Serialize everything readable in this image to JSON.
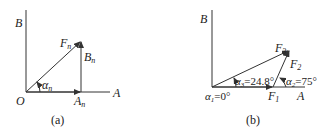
{
  "figure_a": {
    "caption": "(a)",
    "labels": {
      "B": "B",
      "O": "O",
      "A": "A",
      "Fn": "F",
      "Fn_sub": "n",
      "Bn": "B",
      "Bn_sub": "n",
      "An": "A",
      "An_sub": "n",
      "alpha": "α",
      "alpha_sub": "n"
    }
  },
  "figure_b": {
    "caption": "(b)",
    "labels": {
      "B": "B",
      "A": "A",
      "F1": "F",
      "F1_sub": "1",
      "F2": "F",
      "F2_sub": "2",
      "F3": "F",
      "F3_sub": "3",
      "alpha1": "α",
      "alpha1_sub": "1",
      "alpha1_val": "=0°",
      "alpha2": "α",
      "alpha2_sub": "2",
      "alpha2_val": "=75°",
      "alpha3": "α",
      "alpha3_sub": "3",
      "alpha3_val": "=24.8°"
    }
  },
  "colors": {
    "line": "#333333",
    "text": "#222222"
  }
}
